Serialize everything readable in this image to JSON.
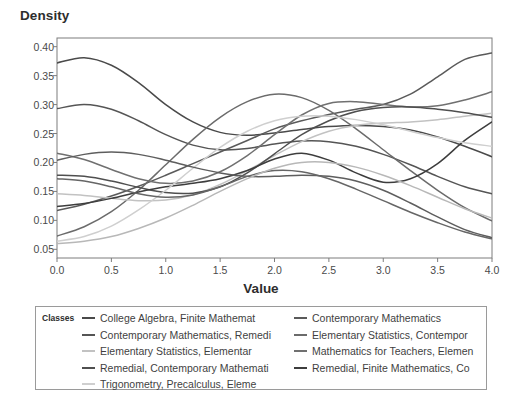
{
  "chart_data": {
    "type": "line",
    "title": "",
    "xlabel": "Value",
    "ylabel": "Density",
    "xlim": [
      0.0,
      4.0
    ],
    "ylim": [
      0.035,
      0.415
    ],
    "grid": false,
    "legend_position": "bottom",
    "legend_title": "Classes",
    "xticks": [
      "0.0",
      "0.5",
      "1.0",
      "1.5",
      "2.0",
      "2.5",
      "3.0",
      "3.5",
      "4.0"
    ],
    "xtick_values": [
      0.0,
      0.5,
      1.0,
      1.5,
      2.0,
      2.5,
      3.0,
      3.5,
      4.0
    ],
    "yticks": [
      "0.05",
      "0.10",
      "0.15",
      "0.20",
      "0.25",
      "0.30",
      "0.35",
      "0.40"
    ],
    "ytick_values": [
      0.05,
      0.1,
      0.15,
      0.2,
      0.25,
      0.3,
      0.35,
      0.4
    ],
    "x": [
      0.0,
      0.25,
      0.5,
      0.75,
      1.0,
      1.25,
      1.5,
      1.75,
      2.0,
      2.25,
      2.5,
      2.75,
      3.0,
      3.25,
      3.5,
      3.75,
      4.0
    ],
    "series": [
      {
        "name": "College Algebra, Finite Mathemat",
        "color": "#4a4a4a",
        "values": [
          0.372,
          0.381,
          0.368,
          0.338,
          0.3,
          0.27,
          0.252,
          0.247,
          0.251,
          0.257,
          0.262,
          0.264,
          0.262,
          0.256,
          0.244,
          0.228,
          0.21
        ]
      },
      {
        "name": "Contemporary Mathematics",
        "color": "#5a5a5a",
        "values": [
          0.117,
          0.128,
          0.142,
          0.159,
          0.178,
          0.198,
          0.218,
          0.238,
          0.258,
          0.272,
          0.283,
          0.292,
          0.3,
          0.318,
          0.348,
          0.378,
          0.389
        ]
      },
      {
        "name": "Contemporary Mathematics, Remedi",
        "color": "#555555",
        "values": [
          0.293,
          0.3,
          0.292,
          0.272,
          0.248,
          0.23,
          0.222,
          0.224,
          0.232,
          0.237,
          0.236,
          0.228,
          0.214,
          0.196,
          0.176,
          0.158,
          0.146
        ]
      },
      {
        "name": "Elementary Statistics, Contempor",
        "color": "#6b6b6b",
        "values": [
          0.073,
          0.089,
          0.115,
          0.152,
          0.196,
          0.24,
          0.278,
          0.305,
          0.318,
          0.312,
          0.29,
          0.258,
          0.222,
          0.186,
          0.152,
          0.122,
          0.099
        ]
      },
      {
        "name": "Elementary Statistics, Elementar",
        "color": "#c2c2c2",
        "values": [
          0.146,
          0.143,
          0.138,
          0.134,
          0.135,
          0.144,
          0.162,
          0.186,
          0.212,
          0.236,
          0.254,
          0.264,
          0.268,
          0.27,
          0.274,
          0.28,
          0.285
        ]
      },
      {
        "name": "Mathematics for Teachers, Elemen",
        "color": "#707070",
        "values": [
          0.216,
          0.205,
          0.188,
          0.172,
          0.164,
          0.168,
          0.184,
          0.212,
          0.248,
          0.282,
          0.302,
          0.305,
          0.3,
          0.296,
          0.298,
          0.308,
          0.322
        ]
      },
      {
        "name": "Remedial, Contemporary Mathemati",
        "color": "#4f4f4f",
        "values": [
          0.178,
          0.176,
          0.168,
          0.157,
          0.148,
          0.147,
          0.158,
          0.182,
          0.215,
          0.248,
          0.272,
          0.288,
          0.295,
          0.296,
          0.292,
          0.286,
          0.278
        ]
      },
      {
        "name": "Remedial, Finite Mathematics, Co",
        "color": "#3d3d3d",
        "values": [
          0.124,
          0.129,
          0.138,
          0.149,
          0.158,
          0.164,
          0.172,
          0.186,
          0.206,
          0.216,
          0.204,
          0.182,
          0.166,
          0.172,
          0.198,
          0.238,
          0.27
        ]
      },
      {
        "name": "Trigonometry, Precalculus, Eleme",
        "color": "#cfcfcf",
        "values": [
          0.064,
          0.072,
          0.09,
          0.118,
          0.152,
          0.19,
          0.226,
          0.254,
          0.272,
          0.28,
          0.28,
          0.274,
          0.265,
          0.254,
          0.243,
          0.234,
          0.228
        ]
      }
    ],
    "extra_series": [
      {
        "name": "descending-dark-1",
        "color": "#5e5e5e",
        "values": [
          0.204,
          0.214,
          0.218,
          0.214,
          0.204,
          0.192,
          0.182,
          0.176,
          0.176,
          0.178,
          0.176,
          0.168,
          0.152,
          0.13,
          0.106,
          0.084,
          0.07
        ]
      },
      {
        "name": "descending-dark-2",
        "color": "#666666",
        "values": [
          0.172,
          0.168,
          0.158,
          0.146,
          0.14,
          0.144,
          0.158,
          0.176,
          0.186,
          0.184,
          0.172,
          0.154,
          0.134,
          0.114,
          0.096,
          0.08,
          0.068
        ]
      },
      {
        "name": "low-flat-light",
        "color": "#b8b8b8",
        "values": [
          0.06,
          0.064,
          0.072,
          0.086,
          0.104,
          0.126,
          0.15,
          0.172,
          0.19,
          0.2,
          0.2,
          0.192,
          0.178,
          0.16,
          0.14,
          0.12,
          0.104
        ]
      }
    ]
  },
  "axes": {
    "y_title": "Density",
    "x_title": "Value"
  },
  "legend": {
    "title": "Classes",
    "left_column": [
      {
        "label": "College Algebra, Finite Mathemat",
        "color": "#4a4a4a"
      },
      {
        "label": "Contemporary Mathematics, Remedi",
        "color": "#555555"
      },
      {
        "label": "Elementary Statistics, Elementar",
        "color": "#c2c2c2"
      },
      {
        "label": "Remedial, Contemporary Mathemati",
        "color": "#4f4f4f"
      },
      {
        "label": "Trigonometry, Precalculus, Eleme",
        "color": "#cfcfcf"
      }
    ],
    "right_column": [
      {
        "label": "Contemporary Mathematics",
        "color": "#5a5a5a"
      },
      {
        "label": "Elementary Statistics, Contempor",
        "color": "#6b6b6b"
      },
      {
        "label": "Mathematics for Teachers, Elemen",
        "color": "#707070"
      },
      {
        "label": "Remedial, Finite Mathematics, Co",
        "color": "#3d3d3d"
      }
    ]
  }
}
